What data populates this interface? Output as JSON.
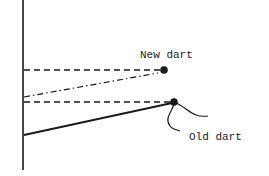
{
  "diagram": {
    "labels": {
      "new_dart": "New dart",
      "old_dart": "Old dart"
    },
    "colors": {
      "ink": "#1a1a1a",
      "background": "#ffffff"
    }
  }
}
